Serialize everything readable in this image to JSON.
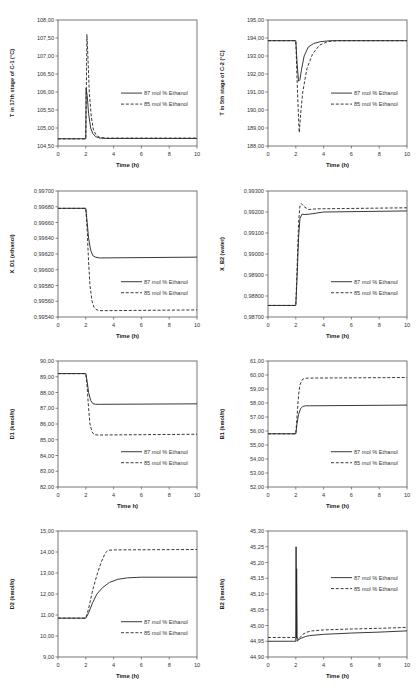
{
  "figure": {
    "legend": [
      "87 mol % Ethanol",
      "85 mol % Ethanol"
    ],
    "xlabel": "Time (h)"
  },
  "chart_data": [
    {
      "id": "c1",
      "type": "line",
      "title": "",
      "xlabel": "Time (h)",
      "ylabel": "T in 17th stage of C-1 (°C)",
      "xlim": [
        0,
        10
      ],
      "ylim": [
        104.5,
        108.0
      ],
      "xticks": [
        "0",
        "2",
        "4",
        "6",
        "8",
        "10"
      ],
      "yticks": [
        "104,50",
        "105,00",
        "105,50",
        "106,00",
        "106,50",
        "107,00",
        "107,50",
        "108,00"
      ],
      "legend_pos": "right-middle",
      "grid": false,
      "series": [
        {
          "name": "87 mol % Ethanol",
          "style": "solid",
          "x": [
            0,
            2,
            2.02,
            2.1,
            2.2,
            2.35,
            2.5,
            2.7,
            3.0,
            3.5,
            10
          ],
          "y": [
            104.7,
            104.7,
            106.1,
            105.9,
            105.4,
            105.0,
            104.85,
            104.76,
            104.72,
            104.71,
            104.71
          ]
        },
        {
          "name": "85 mol % Ethanol",
          "style": "dashed",
          "x": [
            0,
            2,
            2.08,
            2.15,
            2.25,
            2.4,
            2.55,
            2.75,
            3.0,
            3.5,
            10
          ],
          "y": [
            104.7,
            104.7,
            107.6,
            107.0,
            106.0,
            105.3,
            104.95,
            104.8,
            104.74,
            104.72,
            104.72
          ]
        }
      ]
    },
    {
      "id": "c2",
      "type": "line",
      "title": "",
      "xlabel": "Time (h)",
      "ylabel": "T in 5th stage of C-2 (°C)",
      "xlim": [
        0,
        10
      ],
      "ylim": [
        188.0,
        195.0
      ],
      "xticks": [
        "0",
        "2",
        "4",
        "6",
        "8",
        "10"
      ],
      "yticks": [
        "188,00",
        "189,00",
        "190,00",
        "191,00",
        "192,00",
        "193,00",
        "194,00",
        "195,00"
      ],
      "legend_pos": "right-middle",
      "grid": false,
      "series": [
        {
          "name": "87 mol % Ethanol",
          "style": "solid",
          "x": [
            0,
            2,
            2.1,
            2.2,
            2.3,
            2.4,
            2.6,
            2.9,
            3.3,
            3.8,
            4.5,
            10
          ],
          "y": [
            193.85,
            193.85,
            192.5,
            191.6,
            191.7,
            192.2,
            193.0,
            193.5,
            193.7,
            193.8,
            193.85,
            193.85
          ]
        },
        {
          "name": "85 mol % Ethanol",
          "style": "dashed",
          "x": [
            0,
            2,
            2.1,
            2.2,
            2.25,
            2.35,
            2.5,
            2.8,
            3.2,
            3.7,
            4.3,
            5,
            10
          ],
          "y": [
            193.85,
            193.85,
            191.5,
            189.5,
            188.75,
            189.8,
            191.0,
            192.3,
            193.1,
            193.6,
            193.8,
            193.85,
            193.85
          ]
        }
      ]
    },
    {
      "id": "c3",
      "type": "line",
      "title": "",
      "xlabel": "Time (h)",
      "ylabel": "X_D1 (ethanol)",
      "xlim": [
        0,
        10
      ],
      "ylim": [
        0.9954,
        0.997
      ],
      "xticks": [
        "0",
        "2",
        "4",
        "6",
        "8",
        "10"
      ],
      "yticks": [
        "0,99540",
        "0,99560",
        "0,99580",
        "0,99600",
        "0,99620",
        "0,99640",
        "0,99660",
        "0,99680",
        "0,99700"
      ],
      "legend_pos": "right-bottom",
      "grid": false,
      "series": [
        {
          "name": "87 mol % Ethanol",
          "style": "solid",
          "x": [
            0,
            2,
            2.1,
            2.2,
            2.35,
            2.5,
            2.7,
            3.0,
            10
          ],
          "y": [
            0.99678,
            0.99678,
            0.9966,
            0.9964,
            0.99625,
            0.99618,
            0.99616,
            0.99615,
            0.99616
          ]
        },
        {
          "name": "85 mol % Ethanol",
          "style": "dashed",
          "x": [
            0,
            2,
            2.1,
            2.2,
            2.3,
            2.45,
            2.6,
            2.8,
            3.1,
            10
          ],
          "y": [
            0.99678,
            0.99678,
            0.9965,
            0.9961,
            0.9958,
            0.9956,
            0.99552,
            0.99549,
            0.99548,
            0.99549
          ]
        }
      ]
    },
    {
      "id": "c4",
      "type": "line",
      "title": "",
      "xlabel": "Time (h)",
      "ylabel": "X_B2 (water)",
      "xlim": [
        0,
        10
      ],
      "ylim": [
        0.987,
        0.993
      ],
      "xticks": [
        "0",
        "2",
        "4",
        "6",
        "8",
        "10"
      ],
      "yticks": [
        "0,98700",
        "0,98800",
        "0,98900",
        "0,99000",
        "0,99100",
        "0,99200",
        "0,99300"
      ],
      "legend_pos": "right-bottom",
      "grid": false,
      "series": [
        {
          "name": "87 mol % Ethanol",
          "style": "solid",
          "x": [
            0,
            2,
            2.1,
            2.2,
            2.3,
            2.45,
            2.6,
            3.0,
            4.0,
            10
          ],
          "y": [
            0.98755,
            0.98755,
            0.989,
            0.9908,
            0.9917,
            0.9919,
            0.99188,
            0.9919,
            0.992,
            0.99205
          ]
        },
        {
          "name": "85 mol % Ethanol",
          "style": "dashed",
          "x": [
            0,
            2,
            2.1,
            2.2,
            2.3,
            2.4,
            2.6,
            2.9,
            3.5,
            10
          ],
          "y": [
            0.98755,
            0.98755,
            0.9895,
            0.9915,
            0.9923,
            0.9924,
            0.99225,
            0.99212,
            0.99215,
            0.9922
          ]
        }
      ]
    },
    {
      "id": "c5",
      "type": "line",
      "title": "",
      "xlabel": "Time h)",
      "ylabel": "D1 (kmol/h)",
      "xlim": [
        0,
        10
      ],
      "ylim": [
        82.0,
        90.0
      ],
      "xticks": [
        "0",
        "2",
        "4",
        "6",
        "8",
        "10"
      ],
      "yticks": [
        "82,00",
        "83,00",
        "84,00",
        "85,00",
        "86,00",
        "87,00",
        "88,00",
        "89,00",
        "90,00"
      ],
      "legend_pos": "right-bottom",
      "grid": false,
      "series": [
        {
          "name": "87 mol % Ethanol",
          "style": "solid",
          "x": [
            0,
            2,
            2.1,
            2.2,
            2.35,
            2.5,
            2.7,
            3.0,
            10
          ],
          "y": [
            89.2,
            89.2,
            88.7,
            88.0,
            87.5,
            87.3,
            87.25,
            87.25,
            87.28
          ]
        },
        {
          "name": "85 mol % Ethanol",
          "style": "dashed",
          "x": [
            0,
            2,
            2.1,
            2.2,
            2.3,
            2.45,
            2.6,
            2.9,
            10
          ],
          "y": [
            89.2,
            89.2,
            88.3,
            87.0,
            86.0,
            85.5,
            85.32,
            85.3,
            85.35
          ]
        }
      ]
    },
    {
      "id": "c6",
      "type": "line",
      "title": "",
      "xlabel": "Time (h)",
      "ylabel": "B1 (kmol/h)",
      "xlim": [
        0,
        10
      ],
      "ylim": [
        52.0,
        61.0
      ],
      "xticks": [
        "0",
        "2",
        "4",
        "6",
        "8",
        "10"
      ],
      "yticks": [
        "52,00",
        "53,00",
        "54,00",
        "55,00",
        "56,00",
        "57,00",
        "58,00",
        "59,00",
        "60,00",
        "61,00"
      ],
      "legend_pos": "right-bottom",
      "grid": false,
      "series": [
        {
          "name": "87 mol % Ethanol",
          "style": "solid",
          "x": [
            0,
            2,
            2.1,
            2.2,
            2.35,
            2.5,
            2.7,
            3.0,
            10
          ],
          "y": [
            55.8,
            55.8,
            56.6,
            57.2,
            57.6,
            57.75,
            57.8,
            57.8,
            57.85
          ]
        },
        {
          "name": "85 mol % Ethanol",
          "style": "dashed",
          "x": [
            0,
            2,
            2.1,
            2.2,
            2.3,
            2.45,
            2.6,
            2.9,
            10
          ],
          "y": [
            55.8,
            55.8,
            57.2,
            58.6,
            59.3,
            59.65,
            59.75,
            59.78,
            59.82
          ]
        }
      ]
    },
    {
      "id": "c7",
      "type": "line",
      "title": "",
      "xlabel": "Time (h)",
      "ylabel": "D2 (kmol/h)",
      "xlim": [
        0,
        10
      ],
      "ylim": [
        9.0,
        15.0
      ],
      "xticks": [
        "0",
        "2",
        "4",
        "6",
        "8",
        "10"
      ],
      "yticks": [
        "9,00",
        "10,00",
        "11,00",
        "12,00",
        "13,00",
        "14,00",
        "15,00"
      ],
      "legend_pos": "right-bottom",
      "grid": false,
      "series": [
        {
          "name": "87 mol % Ethanol",
          "style": "solid",
          "x": [
            0,
            2,
            2.2,
            2.5,
            2.8,
            3.2,
            3.7,
            4.3,
            5.0,
            6.0,
            10
          ],
          "y": [
            10.85,
            10.85,
            11.1,
            11.6,
            12.0,
            12.3,
            12.55,
            12.7,
            12.77,
            12.8,
            12.8
          ]
        },
        {
          "name": "85 mol % Ethanol",
          "style": "dashed",
          "x": [
            0,
            2,
            2.2,
            2.5,
            2.8,
            3.1,
            3.4,
            3.6,
            4.0,
            10
          ],
          "y": [
            10.85,
            10.85,
            11.3,
            12.2,
            12.9,
            13.5,
            13.95,
            14.08,
            14.1,
            14.12
          ]
        }
      ]
    },
    {
      "id": "c8",
      "type": "line",
      "title": "",
      "xlabel": "Time (h)",
      "ylabel": "B2 (kmol/h)",
      "xlim": [
        0,
        10
      ],
      "ylim": [
        44.9,
        45.3
      ],
      "xticks": [
        "0",
        "2",
        "4",
        "6",
        "8",
        "10"
      ],
      "yticks": [
        "44,90",
        "44,95",
        "45,00",
        "45,05",
        "45,10",
        "45,15",
        "45,20",
        "45,25",
        "45,30"
      ],
      "legend_pos": "right-top",
      "grid": false,
      "series": [
        {
          "name": "87 mol % Ethanol",
          "style": "solid",
          "x": [
            0,
            2,
            2.02,
            2.04,
            2.06,
            2.1,
            2.2,
            2.4,
            2.7,
            3.0,
            4.0,
            6.0,
            8.0,
            10
          ],
          "y": [
            44.95,
            44.95,
            45.25,
            44.96,
            45.18,
            44.95,
            44.955,
            44.96,
            44.965,
            44.968,
            44.972,
            44.976,
            44.979,
            44.983
          ]
        },
        {
          "name": "85 mol % Ethanol",
          "style": "dashed",
          "x": [
            0,
            2,
            2.1,
            2.2,
            2.3,
            2.5,
            2.8,
            3.2,
            4.0,
            6.0,
            8.0,
            10
          ],
          "y": [
            44.962,
            44.962,
            44.962,
            44.955,
            44.962,
            44.972,
            44.979,
            44.983,
            44.986,
            44.989,
            44.991,
            44.994
          ]
        }
      ]
    }
  ]
}
